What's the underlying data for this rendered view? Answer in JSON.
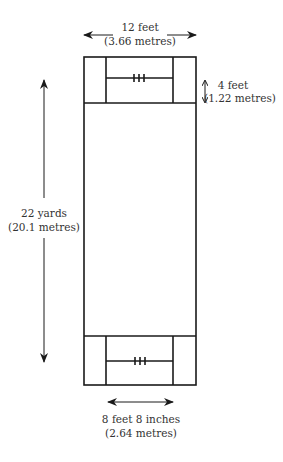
{
  "diagram": {
    "labels": {
      "top_width": {
        "line1": "12 feet",
        "line2": "(3.66 metres)"
      },
      "crease_depth": {
        "line1": "4 feet",
        "line2": "(1.22 metres)"
      },
      "pitch_length": {
        "line1": "22 yards",
        "line2": "(20.1 metres)"
      },
      "stumps_width": {
        "line1": "8 feet 8 inches",
        "line2": "(2.64 metres)"
      }
    },
    "colors": {
      "line": "#1a1a1a",
      "text": "#333333",
      "background": "#ffffff"
    }
  }
}
